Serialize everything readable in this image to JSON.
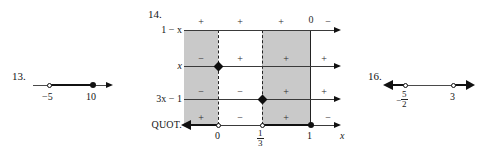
{
  "page": {
    "background": "#ffffff",
    "ink": "#111111",
    "band_color": "#c9c9c9"
  },
  "problems": [
    {
      "id": "13",
      "number_label": "13.",
      "type": "number-line",
      "points": [
        {
          "value": "-5",
          "label": "−5",
          "marker": "open"
        },
        {
          "value": "10",
          "label": "10",
          "marker": "filled"
        }
      ],
      "segments": [
        {
          "from": "-5",
          "to": "10",
          "style": "bold"
        }
      ],
      "left_end": "thin",
      "right_end": "arrow"
    },
    {
      "id": "14",
      "number_label": "14.",
      "type": "sign-chart",
      "axis_label": "x",
      "ticks": [
        {
          "label": "0",
          "marker": "open"
        },
        {
          "label_num": "1",
          "label_den": "3",
          "marker": "open"
        },
        {
          "label": "1",
          "marker": "filled"
        }
      ],
      "rows": [
        {
          "label_html": "1 − x",
          "label_plain": "1 − x",
          "signs": [
            "+",
            "+",
            "+",
            "0",
            "−"
          ],
          "marker": null
        },
        {
          "label_html": "x",
          "label_plain": "x",
          "signs": [
            "−",
            "+",
            "+",
            "+"
          ],
          "marker": {
            "at": "0",
            "shape": "diamond"
          }
        },
        {
          "label_html": "3x − 1",
          "label_plain": "3x − 1",
          "signs": [
            "−",
            "−",
            "+",
            "+"
          ],
          "marker": {
            "at": "1/3",
            "shape": "diamond"
          }
        },
        {
          "label_html": "QUOT.",
          "label_plain": "QUOT.",
          "signs": [
            "+",
            "−",
            "+",
            "−"
          ],
          "marker": null
        }
      ],
      "bands": [
        {
          "from": "-inf",
          "to": "0",
          "shaded": true
        },
        {
          "from": "0",
          "to": "1/3",
          "shaded": false
        },
        {
          "from": "1/3",
          "to": "1",
          "shaded": true
        },
        {
          "from": "1",
          "to": "inf",
          "shaded": false
        }
      ],
      "solution_segments": [
        {
          "from": "-inf",
          "to": "0",
          "style": "bold-arrow-left"
        },
        {
          "from": "1/3",
          "to": "1",
          "style": "bold"
        }
      ]
    },
    {
      "id": "16",
      "number_label": "16.",
      "type": "number-line",
      "points": [
        {
          "value": "-5/2",
          "label_num": "5",
          "label_den": "2",
          "label_sign": "−",
          "marker": "open"
        },
        {
          "value": "3",
          "label": "3",
          "marker": "open"
        }
      ],
      "segments": [
        {
          "from": "-inf",
          "to": "-5/2",
          "style": "bold-arrow-left"
        },
        {
          "from": "3",
          "to": "inf",
          "style": "bold-arrow-right"
        }
      ],
      "middle": "thin"
    }
  ]
}
